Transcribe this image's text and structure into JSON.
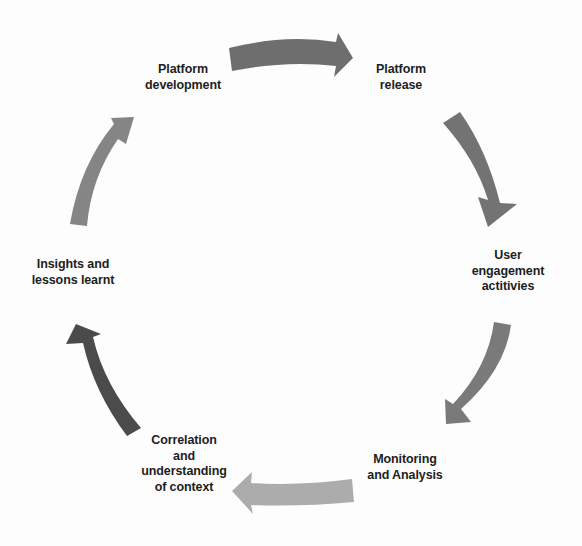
{
  "diagram": {
    "type": "cycle",
    "nodes": [
      {
        "id": "platform-development",
        "lines": [
          "Platform",
          "development"
        ]
      },
      {
        "id": "platform-release",
        "lines": [
          "Platform",
          "release"
        ]
      },
      {
        "id": "user-engagement",
        "lines": [
          "User",
          "engagement",
          "actitivies"
        ]
      },
      {
        "id": "monitoring-analysis",
        "lines": [
          "Monitoring",
          "and Analysis"
        ]
      },
      {
        "id": "correlation-context",
        "lines": [
          "Correlation",
          "and",
          "understanding",
          "of context"
        ]
      },
      {
        "id": "insights-lessons",
        "lines": [
          "Insights and",
          "lessons learnt"
        ]
      }
    ],
    "arrows": [
      {
        "from": "platform-development",
        "to": "platform-release",
        "color": "#6e6e6e"
      },
      {
        "from": "platform-release",
        "to": "user-engagement",
        "color": "#737373"
      },
      {
        "from": "user-engagement",
        "to": "monitoring-analysis",
        "color": "#7a7a7a"
      },
      {
        "from": "monitoring-analysis",
        "to": "correlation-context",
        "color": "#acacac"
      },
      {
        "from": "correlation-context",
        "to": "insights-lessons",
        "color": "#4b4b4b"
      },
      {
        "from": "insights-lessons",
        "to": "platform-development",
        "color": "#858585"
      }
    ]
  }
}
